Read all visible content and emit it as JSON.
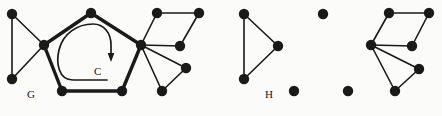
{
  "figure": {
    "background_color": "#fbfbf9",
    "ink_color": "#1a1a1a",
    "width": 442,
    "height": 116,
    "labels": [
      {
        "text": "G",
        "x": 27,
        "y": 98,
        "name": "graph-g-label"
      },
      {
        "text": "C",
        "x": 94,
        "y": 75,
        "name": "cycle-c-label"
      },
      {
        "text": "H",
        "x": 265,
        "y": 98,
        "name": "subgraph-h-label"
      }
    ]
  },
  "graph_g": {
    "name": "G",
    "vertex_radius": 5.2,
    "vertices": [
      {
        "id": "g1",
        "x": 12,
        "y": 14,
        "name": "vertex-g-top-left"
      },
      {
        "id": "g2",
        "x": 12,
        "y": 79,
        "name": "vertex-g-bottom-left"
      },
      {
        "id": "g3",
        "x": 44,
        "y": 45,
        "name": "vertex-g-left-hub"
      },
      {
        "id": "g4",
        "x": 91,
        "y": 13,
        "name": "vertex-g-top-middle"
      },
      {
        "id": "g5",
        "x": 141,
        "y": 45,
        "name": "vertex-g-right-hub"
      },
      {
        "id": "g6",
        "x": 122,
        "y": 91,
        "name": "vertex-g-bottom-right-pentagon"
      },
      {
        "id": "g7",
        "x": 62,
        "y": 91,
        "name": "vertex-g-bottom-left-pentagon"
      },
      {
        "id": "g8",
        "x": 157,
        "y": 13,
        "name": "vertex-g-quad-top-left"
      },
      {
        "id": "g9",
        "x": 199,
        "y": 13,
        "name": "vertex-g-quad-top-right"
      },
      {
        "id": "g10",
        "x": 180,
        "y": 46,
        "name": "vertex-g-quad-bottom"
      },
      {
        "id": "g11",
        "x": 186,
        "y": 68,
        "name": "vertex-g-triangle-right"
      },
      {
        "id": "g12",
        "x": 162,
        "y": 91,
        "name": "vertex-g-triangle-bottom"
      }
    ],
    "edges_thin": [
      {
        "from": "g1",
        "to": "g2",
        "name": "edge-g1-g2"
      },
      {
        "from": "g1",
        "to": "g3",
        "name": "edge-g1-g3"
      },
      {
        "from": "g2",
        "to": "g3",
        "name": "edge-g2-g3"
      },
      {
        "from": "g5",
        "to": "g8",
        "name": "edge-g5-g8"
      },
      {
        "from": "g8",
        "to": "g9",
        "name": "edge-g8-g9"
      },
      {
        "from": "g9",
        "to": "g10",
        "name": "edge-g9-g10"
      },
      {
        "from": "g5",
        "to": "g10",
        "name": "edge-g5-g10"
      },
      {
        "from": "g5",
        "to": "g11",
        "name": "edge-g5-g11"
      },
      {
        "from": "g5",
        "to": "g12",
        "name": "edge-g5-g12"
      },
      {
        "from": "g11",
        "to": "g12",
        "name": "edge-g11-g12"
      }
    ],
    "edges_bold": [
      {
        "from": "g3",
        "to": "g4",
        "name": "cycle-edge-g3-g4"
      },
      {
        "from": "g4",
        "to": "g5",
        "name": "cycle-edge-g4-g5"
      },
      {
        "from": "g5",
        "to": "g6",
        "name": "cycle-edge-g5-g6"
      },
      {
        "from": "g6",
        "to": "g7",
        "name": "cycle-edge-g6-g7"
      },
      {
        "from": "g7",
        "to": "g3",
        "name": "cycle-edge-g7-g3"
      }
    ],
    "cycle_arrow": {
      "name": "cycle-direction-arrow",
      "path": "M 107 80 L 73 80 C 58 80 56 62 59 50 C 63 33 78 24 93 24 C 104 24 111 33 111 45 L 111 55",
      "arrow_tip": {
        "x": 111,
        "y": 60
      }
    }
  },
  "subgraph_h": {
    "name": "H",
    "vertex_radius": 5.2,
    "components": [
      {
        "name": "triangle-component",
        "vertices": [
          {
            "id": "h1",
            "x": 244,
            "y": 14,
            "name": "vertex-h-triangle-top"
          },
          {
            "id": "h2",
            "x": 244,
            "y": 79,
            "name": "vertex-h-triangle-bottom"
          },
          {
            "id": "h3",
            "x": 278,
            "y": 46,
            "name": "vertex-h-triangle-right"
          }
        ],
        "edges": [
          {
            "from": "h1",
            "to": "h2",
            "name": "edge-h1-h2"
          },
          {
            "from": "h1",
            "to": "h3",
            "name": "edge-h1-h3"
          },
          {
            "from": "h2",
            "to": "h3",
            "name": "edge-h2-h3"
          }
        ]
      },
      {
        "name": "isolated-vertices",
        "vertices": [
          {
            "id": "h4",
            "x": 323,
            "y": 14,
            "name": "vertex-h-isolated-top"
          },
          {
            "id": "h5",
            "x": 294,
            "y": 91,
            "name": "vertex-h-isolated-bottom-left"
          },
          {
            "id": "h6",
            "x": 348,
            "y": 91,
            "name": "vertex-h-isolated-bottom-right"
          }
        ],
        "edges": []
      },
      {
        "name": "right-component",
        "vertices": [
          {
            "id": "h7",
            "x": 371,
            "y": 45,
            "name": "vertex-h-right-hub"
          },
          {
            "id": "h8",
            "x": 389,
            "y": 13,
            "name": "vertex-h-quad-top-left"
          },
          {
            "id": "h9",
            "x": 429,
            "y": 13,
            "name": "vertex-h-quad-top-right"
          },
          {
            "id": "h10",
            "x": 412,
            "y": 46,
            "name": "vertex-h-quad-bottom"
          },
          {
            "id": "h11",
            "x": 419,
            "y": 69,
            "name": "vertex-h-triangle-right-node"
          },
          {
            "id": "h12",
            "x": 395,
            "y": 91,
            "name": "vertex-h-triangle-bottom-node"
          }
        ],
        "edges": [
          {
            "from": "h7",
            "to": "h8",
            "name": "edge-h7-h8"
          },
          {
            "from": "h8",
            "to": "h9",
            "name": "edge-h8-h9"
          },
          {
            "from": "h9",
            "to": "h10",
            "name": "edge-h9-h10"
          },
          {
            "from": "h7",
            "to": "h10",
            "name": "edge-h7-h10"
          },
          {
            "from": "h7",
            "to": "h11",
            "name": "edge-h7-h11"
          },
          {
            "from": "h7",
            "to": "h12",
            "name": "edge-h7-h12"
          },
          {
            "from": "h11",
            "to": "h12",
            "name": "edge-h11-h12"
          }
        ]
      }
    ]
  }
}
